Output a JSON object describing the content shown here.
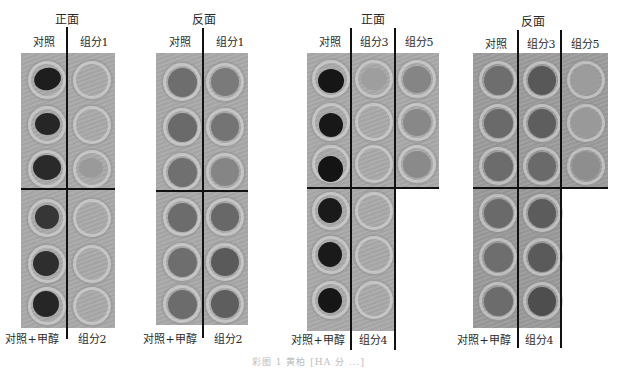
{
  "figure": {
    "panels": [
      {
        "id": "panel-1",
        "title": "正面",
        "top_labels": [
          "对照",
          "组分1"
        ],
        "bottom_labels": [
          "对照+甲醇",
          "组分2"
        ],
        "columns_top": 2,
        "columns_bottom": 2,
        "rows_top": 3,
        "rows_bottom": 3,
        "wells": {
          "top": [
            [
              "#1e1e1e",
              "#a2a2a2"
            ],
            [
              "#262626",
              "#a5a5a5"
            ],
            [
              "#2a2a2a",
              "#9a9a9a"
            ]
          ],
          "bottom": [
            [
              "#363636",
              "#a0a0a0"
            ],
            [
              "#2e2e2e",
              "#a6a6a6"
            ],
            [
              "#262626",
              "#a3a3a3"
            ]
          ]
        }
      },
      {
        "id": "panel-2",
        "title": "反面",
        "top_labels": [
          "对照",
          "组分1"
        ],
        "bottom_labels": [
          "对照+甲醇",
          "组分2"
        ],
        "columns_top": 2,
        "columns_bottom": 2,
        "rows_top": 3,
        "rows_bottom": 3,
        "wells": {
          "top": [
            [
              "#6e6e6e",
              "#7a7a7a"
            ],
            [
              "#6a6a6a",
              "#747474"
            ],
            [
              "#707070",
              "#858585"
            ]
          ],
          "bottom": [
            [
              "#6c6c6c",
              "#686868"
            ],
            [
              "#6e6e6e",
              "#5a5a5a"
            ],
            [
              "#6c6c6c",
              "#5e5e5e"
            ]
          ]
        }
      },
      {
        "id": "panel-3",
        "title": "正面",
        "top_labels": [
          "对照",
          "组分3",
          "组分5"
        ],
        "bottom_labels": [
          "对照+甲醇",
          "组分4"
        ],
        "columns_top": 3,
        "columns_bottom": 2,
        "rows_top": 3,
        "rows_bottom": 3,
        "wells": {
          "top": [
            [
              "#161616",
              "#9e9e9e",
              "#858585"
            ],
            [
              "#181818",
              "#a4a4a4",
              "#888888"
            ],
            [
              "#141414",
              "#a5a5a5",
              "#8a8a8a"
            ]
          ],
          "bottom": [
            [
              "#1a1a1a",
              "#a0a0a0"
            ],
            [
              "#1a1a1a",
              "#a3a3a3"
            ],
            [
              "#161616",
              "#a2a2a2"
            ]
          ]
        }
      },
      {
        "id": "panel-4",
        "title": "反面",
        "top_labels": [
          "对照",
          "组分3",
          "组分5"
        ],
        "bottom_labels": [
          "对照+甲醇",
          "组分4"
        ],
        "columns_top": 3,
        "columns_bottom": 2,
        "rows_top": 3,
        "rows_bottom": 3,
        "wells": {
          "top": [
            [
              "#6e6e6e",
              "#585858",
              "#9c9c9c"
            ],
            [
              "#6a6a6a",
              "#5e5e5e",
              "#999999"
            ],
            [
              "#6c6c6c",
              "#6a6a6a",
              "#8e8e8e"
            ]
          ],
          "bottom": [
            [
              "#6a6a6a",
              "#5c5c5c"
            ],
            [
              "#6e6e6e",
              "#5a5a5a"
            ],
            [
              "#6c6c6c",
              "#4e4e4e"
            ]
          ]
        }
      }
    ],
    "caption": "彩图 1  黄柏 [HA 分 ...]"
  },
  "colors": {
    "plate_background": "#a9a9a9",
    "divider": "#111111",
    "text": "#2a2a2a"
  }
}
